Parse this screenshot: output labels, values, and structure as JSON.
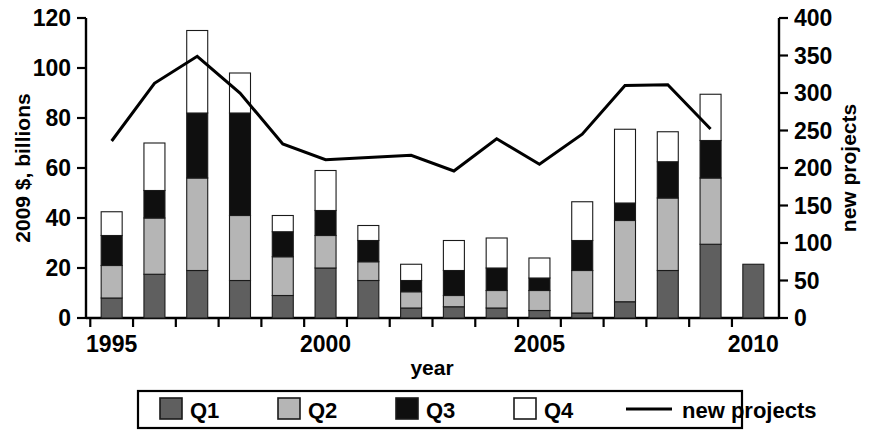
{
  "chart_data": {
    "type": "bar",
    "title": "",
    "xlabel": "year",
    "ylabel": "2009 $, billions",
    "y2label": "new projects",
    "ylim": [
      0,
      120
    ],
    "y2lim": [
      0,
      400
    ],
    "xlim": [
      1994.4,
      2010.6
    ],
    "grid": false,
    "legend_position": "bottom",
    "x_tick_labels": [
      "1995",
      "2000",
      "2005",
      "2010"
    ],
    "x_tick_values": [
      1995,
      2000,
      2005,
      2010
    ],
    "y_tick_labels": [
      "0",
      "20",
      "40",
      "60",
      "80",
      "100",
      "120"
    ],
    "y_tick_values": [
      0,
      20,
      40,
      60,
      80,
      100,
      120
    ],
    "y2_tick_labels": [
      "0",
      "50",
      "100",
      "150",
      "200",
      "250",
      "300",
      "350",
      "400"
    ],
    "y2_tick_values": [
      0,
      50,
      100,
      150,
      200,
      250,
      300,
      350,
      400
    ],
    "categories": [
      1995,
      1996,
      1997,
      1998,
      1999,
      2000,
      2001,
      2002,
      2003,
      2004,
      2005,
      2006,
      2007,
      2008,
      2009,
      2010
    ],
    "series": [
      {
        "name": "Q1",
        "color": "#5f5f5f",
        "values": [
          8.0,
          17.5,
          19.0,
          15.0,
          9.0,
          20.0,
          15.0,
          4.0,
          4.5,
          4.0,
          3.0,
          2.0,
          6.5,
          19.0,
          29.5,
          21.5
        ]
      },
      {
        "name": "Q2",
        "color": "#b5b5b5",
        "values": [
          13.0,
          22.5,
          37.0,
          26.0,
          15.5,
          13.0,
          7.5,
          6.5,
          4.5,
          7.0,
          8.0,
          17.0,
          32.5,
          29.0,
          26.5,
          0.0
        ]
      },
      {
        "name": "Q3",
        "color": "#0f0f0f",
        "values": [
          12.0,
          11.0,
          26.0,
          41.0,
          10.0,
          10.0,
          8.5,
          4.5,
          10.0,
          9.0,
          5.0,
          12.0,
          7.0,
          14.5,
          15.0,
          0.0
        ]
      },
      {
        "name": "Q4",
        "color": "#ffffff",
        "values": [
          9.5,
          19.0,
          33.0,
          16.0,
          6.5,
          16.0,
          6.0,
          6.5,
          12.0,
          12.0,
          8.0,
          15.5,
          29.5,
          12.0,
          18.5,
          0.0
        ]
      }
    ],
    "line_series": {
      "name": "new projects",
      "color": "#000000",
      "x": [
        1995,
        1996,
        1997,
        1998,
        1999,
        2000,
        2001,
        2002,
        2003,
        2004,
        2005,
        2006,
        2007,
        2008,
        2009
      ],
      "values": [
        236,
        313,
        349,
        300,
        232,
        211,
        214,
        217,
        196,
        239,
        205,
        245,
        310,
        311,
        252
      ]
    }
  },
  "legend": {
    "items": [
      {
        "label": "Q1",
        "marker": "square",
        "color": "#5f5f5f"
      },
      {
        "label": "Q2",
        "marker": "square",
        "color": "#b5b5b5"
      },
      {
        "label": "Q3",
        "marker": "square",
        "color": "#0f0f0f"
      },
      {
        "label": "Q4",
        "marker": "square",
        "color": "#ffffff"
      },
      {
        "label": "new projects",
        "marker": "line",
        "color": "#000000"
      }
    ]
  }
}
